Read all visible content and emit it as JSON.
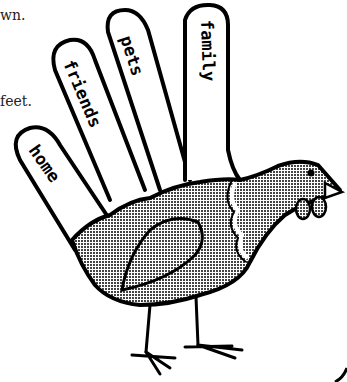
{
  "page": {
    "text_fragments": [
      "wn.",
      "feet."
    ],
    "colors": {
      "ink": "#000000",
      "background": "#ffffff",
      "body_fill": "#b8b8b8"
    }
  },
  "illustration": {
    "subject": "hand-turkey",
    "fingers": [
      {
        "label": "home"
      },
      {
        "label": "friends"
      },
      {
        "label": "pets"
      },
      {
        "label": "family"
      }
    ]
  }
}
